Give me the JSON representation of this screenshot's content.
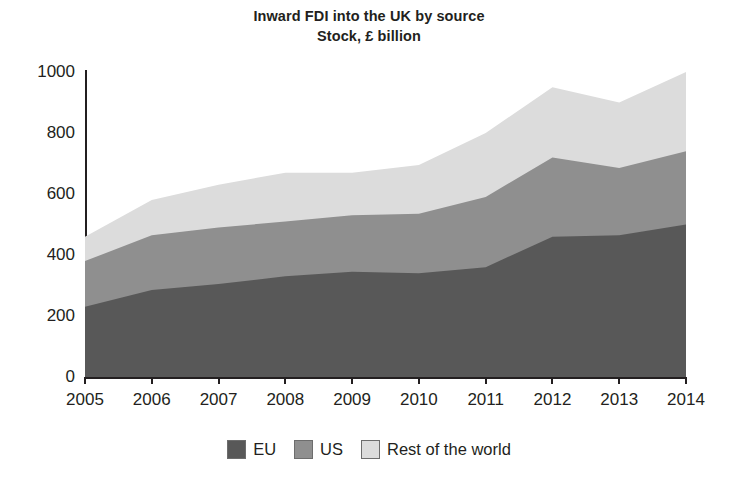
{
  "chart_data": {
    "type": "area",
    "stacked": true,
    "title": "Inward FDI into the UK by source",
    "subtitle": "Stock, £ billion",
    "xlabel": "",
    "ylabel": "",
    "x": [
      2005,
      2006,
      2007,
      2008,
      2009,
      2010,
      2011,
      2012,
      2013,
      2014
    ],
    "categories": [
      "2005",
      "2006",
      "2007",
      "2008",
      "2009",
      "2010",
      "2011",
      "2012",
      "2013",
      "2014"
    ],
    "series": [
      {
        "name": "EU",
        "color": "#585858",
        "values": [
          230,
          285,
          305,
          330,
          345,
          340,
          360,
          460,
          465,
          500
        ]
      },
      {
        "name": "US",
        "color": "#8f8f8f",
        "values": [
          150,
          180,
          185,
          180,
          185,
          195,
          230,
          260,
          220,
          240
        ]
      },
      {
        "name": "Rest of the world",
        "color": "#dcdcdc",
        "values": [
          80,
          115,
          140,
          160,
          140,
          160,
          210,
          230,
          215,
          260
        ]
      }
    ],
    "totals": [
      460,
      580,
      630,
      670,
      670,
      695,
      800,
      950,
      900,
      1000
    ],
    "ylim": [
      0,
      1000
    ],
    "yticks": [
      0,
      200,
      400,
      600,
      800,
      1000
    ],
    "ytick_labels": [
      "0",
      "200",
      "400",
      "600",
      "800",
      "1000"
    ],
    "xlim": [
      2005,
      2014
    ],
    "grid": false,
    "legend_position": "bottom"
  },
  "legend": {
    "items": [
      {
        "label": "EU",
        "swatch": "#585858"
      },
      {
        "label": "US",
        "swatch": "#8f8f8f"
      },
      {
        "label": "Rest of the world",
        "swatch": "#dcdcdc"
      }
    ]
  },
  "colors": {
    "background": "#ffffff",
    "text": "#231f20",
    "axis": "#231f20",
    "eu": "#585858",
    "us": "#8f8f8f",
    "row": "#dcdcdc"
  }
}
